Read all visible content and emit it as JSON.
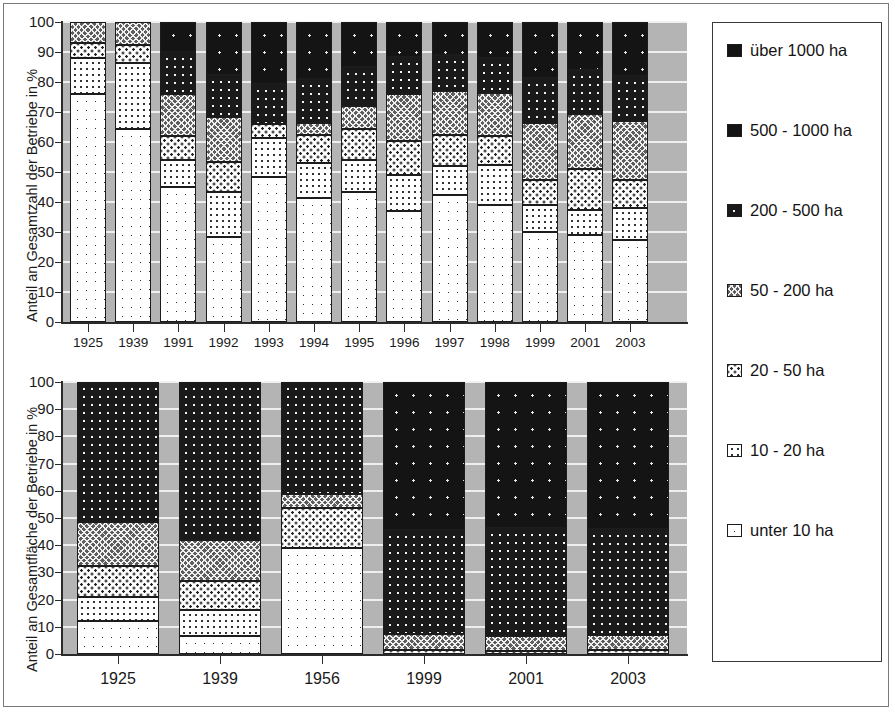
{
  "figure": {
    "legend_title": "",
    "legend": [
      {
        "key": "o1000",
        "label": "über 1000 ha",
        "pattern": "solid-black",
        "color": "#141414"
      },
      {
        "key": "s500_1000",
        "label": "500 - 1000 ha",
        "pattern": "black-sparse-dots",
        "color": "#141414"
      },
      {
        "key": "s200_500",
        "label": "200 - 500 ha",
        "pattern": "black-white-dots",
        "color": "#1a1a1a"
      },
      {
        "key": "s50_200",
        "label": "50 - 200 ha",
        "pattern": "grey-crosshatch",
        "color": "#5d5d5d"
      },
      {
        "key": "s20_50",
        "label": "20 - 50 ha",
        "pattern": "white-dense-dots",
        "color": "#ffffff"
      },
      {
        "key": "s10_20",
        "label": "10 - 20 ha",
        "pattern": "white-medium-dots",
        "color": "#ffffff"
      },
      {
        "key": "u10",
        "label": "unter 10 ha",
        "pattern": "white-sparse-dots",
        "color": "#ffffff"
      }
    ]
  },
  "chart_data": [
    {
      "type": "bar",
      "stacked": true,
      "title": "",
      "xlabel": "",
      "ylabel": "Anteil an Gesamtzahl der Betriebe in %",
      "ylim": [
        0,
        100
      ],
      "yticks": [
        0,
        10,
        20,
        30,
        40,
        50,
        60,
        70,
        80,
        90,
        100
      ],
      "ytick_labels": [
        "0",
        "10",
        "20",
        "30",
        "40",
        "50",
        "60",
        "70",
        "80",
        "90",
        "100"
      ],
      "grid": true,
      "legend_position": "right-outside",
      "categories": [
        "1925",
        "1939",
        "1991",
        "1992",
        "1993",
        "1994",
        "1995",
        "1996",
        "1997",
        "1998",
        "1999",
        "2001",
        "2003"
      ],
      "series": [
        {
          "name": "unter 10 ha",
          "key": "u10",
          "values": [
            76,
            64.5,
            45,
            28.5,
            48.5,
            41.5,
            43.5,
            37,
            42.5,
            39,
            30,
            29,
            27.5
          ]
        },
        {
          "name": "10 - 20 ha",
          "key": "s10_20",
          "values": [
            12,
            22,
            9,
            15,
            13,
            11.5,
            10.5,
            12,
            9.5,
            13.5,
            9,
            8.5,
            10.5
          ]
        },
        {
          "name": "20 - 50 ha",
          "key": "s20_50",
          "values": [
            5,
            6,
            8,
            10,
            4.5,
            9.5,
            10.5,
            11.5,
            10.5,
            9.5,
            8.5,
            13.5,
            9.5
          ]
        },
        {
          "name": "50 - 200 ha",
          "key": "s50_200",
          "values": [
            7,
            7.5,
            14,
            15,
            0,
            4,
            7.5,
            15.5,
            14.5,
            14.5,
            19,
            18.5,
            19.5
          ]
        },
        {
          "name": "200 - 500 ha",
          "key": "s200_500",
          "values": [
            0,
            0,
            14,
            14,
            13.5,
            14.5,
            13,
            12.5,
            12,
            11.5,
            15,
            14.5,
            15
          ]
        },
        {
          "name": "500 - 1000 ha",
          "key": "s500_1000",
          "values": [
            0,
            0,
            10,
            17.5,
            20.5,
            19,
            15,
            11.5,
            11,
            12,
            18.5,
            16,
            18
          ]
        },
        {
          "name": "über 1000 ha",
          "key": "o1000",
          "values": [
            0,
            0,
            0,
            0,
            0,
            0,
            0,
            0,
            0,
            0,
            0,
            0,
            0
          ]
        }
      ]
    },
    {
      "type": "bar",
      "stacked": true,
      "title": "",
      "xlabel": "",
      "ylabel": "Anteil an Gesamtfläche der Betriebe in %",
      "ylim": [
        0,
        100
      ],
      "yticks": [
        0,
        10,
        20,
        30,
        40,
        50,
        60,
        70,
        80,
        90,
        100
      ],
      "ytick_labels": [
        "0",
        "10",
        "20",
        "30",
        "40",
        "50",
        "60",
        "70",
        "80",
        "90",
        "100"
      ],
      "grid": true,
      "legend_position": "right-outside",
      "categories": [
        "1925",
        "1939",
        "1956",
        "1999",
        "2001",
        "2003"
      ],
      "series": [
        {
          "name": "unter 10 ha",
          "key": "u10",
          "values": [
            12,
            6.5,
            39,
            0,
            0,
            0
          ]
        },
        {
          "name": "10 - 20 ha",
          "key": "s10_20",
          "values": [
            9,
            9.5,
            0,
            0,
            0,
            0
          ]
        },
        {
          "name": "20 - 50 ha",
          "key": "s20_50",
          "values": [
            11.5,
            11,
            14.5,
            1.5,
            1,
            1.5
          ]
        },
        {
          "name": "50 - 200 ha",
          "key": "s50_200",
          "values": [
            16,
            15,
            5.5,
            6,
            5.5,
            5.5
          ]
        },
        {
          "name": "200 - 500 ha",
          "key": "s200_500",
          "values": [
            51.5,
            58,
            41,
            38,
            40,
            39
          ]
        },
        {
          "name": "500 - 1000 ha",
          "key": "s500_1000",
          "values": [
            0,
            0,
            0,
            54.5,
            53.5,
            54
          ]
        },
        {
          "name": "über 1000 ha",
          "key": "o1000",
          "values": [
            0,
            0,
            0,
            0,
            0,
            0
          ]
        }
      ]
    }
  ]
}
